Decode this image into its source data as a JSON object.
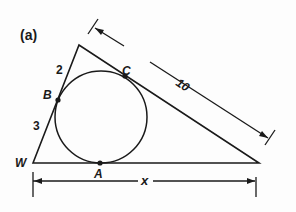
{
  "figure": {
    "panel_label": "(a)",
    "points": {
      "W": "W",
      "A": "A",
      "B": "B",
      "C": "C"
    },
    "segment_labels": {
      "WB": "3",
      "B_apex": "2",
      "apex_right": "10",
      "base": "x"
    }
  },
  "colors": {
    "ink": "#1a1a1a",
    "background": "#fdfdfd"
  }
}
